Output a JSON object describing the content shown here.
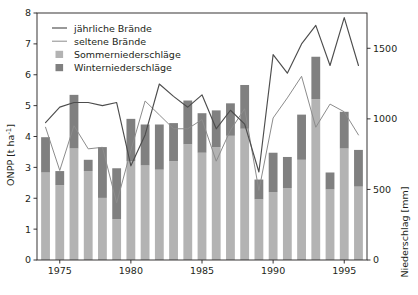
{
  "chart_data": {
    "type": "bar",
    "combo": "stacked-bar-plus-lines",
    "title": "",
    "xlabel": "",
    "ylabel": "ONPP [t ha⁻¹]",
    "y2label": "Niederschlag [mm]",
    "x": [
      1974,
      1975,
      1976,
      1977,
      1978,
      1979,
      1980,
      1981,
      1982,
      1983,
      1984,
      1985,
      1986,
      1987,
      1988,
      1989,
      1990,
      1991,
      1992,
      1993,
      1994,
      1995,
      1996
    ],
    "xlim": [
      1973.4,
      1996.6
    ],
    "ylim": [
      0,
      8
    ],
    "y2lim": [
      0,
      1750
    ],
    "yticks": [
      0,
      1,
      2,
      3,
      4,
      5,
      6,
      7,
      8
    ],
    "y2ticks": [
      0,
      500,
      1000,
      1500
    ],
    "xticks": [
      1975,
      1980,
      1985,
      1990,
      1995
    ],
    "xticklabels": [
      "1975",
      "1980",
      "1985",
      "1990",
      "1995"
    ],
    "grid": false,
    "legend_position": "top-left",
    "colors": {
      "jaehrliche_braende": "#4d4d4d",
      "seltene_braende": "#8c8c8c",
      "sommerniederschlaege": "#b3b3b3",
      "winterniederschlaege": "#808080",
      "axis": "#231f20"
    },
    "series": [
      {
        "name": "jährliche Brände",
        "type": "line",
        "axis": "left",
        "color": "#4d4d4d",
        "x": [
          1974,
          1975,
          1976,
          1977,
          1978,
          1979,
          1980,
          1981,
          1982,
          1983,
          1984,
          1985,
          1986,
          1987,
          1988,
          1989,
          1990,
          1991,
          1992,
          1993,
          1994,
          1995,
          1996
        ],
        "values": [
          4.45,
          4.95,
          5.1,
          5.1,
          5.0,
          5.1,
          3.05,
          4.05,
          5.7,
          5.3,
          4.95,
          5.35,
          4.25,
          4.85,
          4.4,
          2.85,
          6.65,
          6.05,
          7.0,
          7.6,
          6.3,
          7.85,
          6.3
        ]
      },
      {
        "name": "seltene Brände",
        "type": "line",
        "axis": "left",
        "color": "#8c8c8c",
        "x": [
          1974,
          1975,
          1976,
          1977,
          1978,
          1979,
          1980,
          1981,
          1982,
          1983,
          1984,
          1985,
          1986,
          1987,
          1988,
          1989,
          1990,
          1991,
          1992,
          1993,
          1994,
          1995,
          1996
        ],
        "values": [
          4.3,
          2.9,
          4.35,
          3.6,
          3.65,
          1.85,
          3.55,
          5.15,
          4.7,
          4.25,
          4.25,
          4.55,
          3.2,
          4.2,
          4.9,
          2.25,
          4.6,
          5.25,
          5.95,
          4.3,
          5.05,
          4.8,
          4.05
        ]
      },
      {
        "name": "Sommerniederschläge",
        "type": "bar-stack-bottom",
        "axis": "right",
        "color": "#b3b3b3",
        "x": [
          1974,
          1975,
          1976,
          1977,
          1978,
          1979,
          1980,
          1981,
          1982,
          1983,
          1984,
          1985,
          1986,
          1987,
          1988,
          1989,
          1990,
          1991,
          1992,
          1993,
          1994,
          1995,
          1996
        ],
        "values": [
          620,
          530,
          790,
          630,
          440,
          290,
          700,
          670,
          640,
          700,
          820,
          760,
          800,
          880,
          930,
          430,
          480,
          510,
          710,
          1140,
          500,
          790,
          520
        ],
        "values_t_ha": [
          0.97,
          0.82,
          1.56,
          0.99,
          0.67,
          0.45,
          1.02,
          0.98,
          0.96,
          1.08,
          1.18,
          1.1,
          1.16,
          1.28,
          1.33,
          0.53,
          0.63,
          0.71,
          1.0,
          1.36,
          0.62,
          0.99,
          0.64
        ]
      },
      {
        "name": "Winterniederschläge",
        "type": "bar-stack-top",
        "axis": "right",
        "color": "#808080",
        "x": [
          1974,
          1975,
          1976,
          1977,
          1978,
          1979,
          1980,
          1981,
          1982,
          1983,
          1984,
          1985,
          1986,
          1987,
          1988,
          1989,
          1990,
          1991,
          1992,
          1993,
          1994,
          1995,
          1996
        ],
        "values": [
          250,
          100,
          380,
          80,
          360,
          360,
          300,
          290,
          320,
          270,
          310,
          280,
          260,
          230,
          310,
          140,
          280,
          220,
          320,
          300,
          120,
          260,
          260
        ],
        "totals": [
          870,
          630,
          1170,
          710,
          800,
          650,
          1000,
          960,
          960,
          970,
          1130,
          1040,
          1060,
          1110,
          1240,
          570,
          760,
          730,
          1030,
          1440,
          620,
          1050,
          780
        ],
        "totals_t_ha": [
          1.36,
          0.96,
          1.85,
          1.05,
          1.26,
          1.02,
          1.39,
          1.34,
          1.39,
          1.4,
          1.7,
          1.5,
          1.72,
          1.73,
          1.9,
          0.89,
          1.08,
          1.04,
          1.46,
          2.2,
          0.97,
          1.39,
          1.15
        ]
      }
    ],
    "legend": [
      {
        "label": "jährliche Brände",
        "marker": "line",
        "color": "#4d4d4d"
      },
      {
        "label": "seltene Brände",
        "marker": "line",
        "color": "#8c8c8c"
      },
      {
        "label": "Sommerniederschläge",
        "marker": "square",
        "color": "#b3b3b3"
      },
      {
        "label": "Winterniederschläge",
        "marker": "square",
        "color": "#808080"
      }
    ]
  },
  "axes": {
    "left_title_main": "ONPP [t ha",
    "left_title_sup": "-1",
    "left_title_tail": "]",
    "right_title": "Niederschlag [mm]",
    "ytick_labels": [
      "0",
      "1",
      "2",
      "3",
      "4",
      "5",
      "6",
      "7",
      "8"
    ],
    "y2tick_labels": [
      "0",
      "500",
      "1000",
      "1500"
    ],
    "xtick_labels": [
      "1975",
      "1980",
      "1985",
      "1990",
      "1995"
    ]
  }
}
